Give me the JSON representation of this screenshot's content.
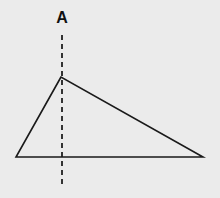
{
  "diagram": {
    "label": "A",
    "background": "#ebebeb",
    "triangle": {
      "apex": [
        61,
        77
      ],
      "left": [
        16,
        157
      ],
      "right": [
        203,
        157
      ],
      "stroke": "#1a1a1a"
    },
    "axis_line": {
      "x": 62,
      "y_start": 35,
      "y_end": 183,
      "style": "dashed"
    }
  }
}
